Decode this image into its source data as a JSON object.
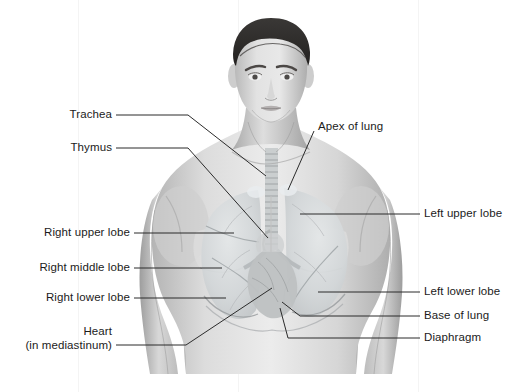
{
  "figure": {
    "background_color": "#ffffff",
    "line_color": "#2b2b2b",
    "text_color": "#1b1b1b",
    "illustration": {
      "name": "male-torso-anterior-view",
      "description": "Grayscale anterior view of a male head, neck, shoulders and chest with lungs, trachea, bronchi and heart shown within the thorax",
      "palette": {
        "skin_light": "#e6e6e6",
        "skin_mid": "#c9c9c9",
        "skin_shadow": "#a8a8a8",
        "hair_dark": "#2f2d2c",
        "lung_tint": "#d3d6d8",
        "airway": "#bfc3c5",
        "heart_tint": "#b9bcbd"
      }
    }
  },
  "labels": {
    "left": [
      {
        "id": "trachea",
        "text": "Trachea",
        "text2": ""
      },
      {
        "id": "thymus",
        "text": "Thymus",
        "text2": ""
      },
      {
        "id": "right-upper-lobe",
        "text": "Right upper lobe",
        "text2": ""
      },
      {
        "id": "right-middle-lobe",
        "text": "Right middle lobe",
        "text2": ""
      },
      {
        "id": "right-lower-lobe",
        "text": "Right lower lobe",
        "text2": ""
      },
      {
        "id": "heart",
        "text": "Heart",
        "text2": "(in mediastinum)"
      }
    ],
    "right": [
      {
        "id": "apex-of-lung",
        "text": "Apex of lung"
      },
      {
        "id": "left-upper-lobe",
        "text": "Left upper lobe"
      },
      {
        "id": "left-lower-lobe",
        "text": "Left lower lobe"
      },
      {
        "id": "base-of-lung",
        "text": "Base of lung"
      },
      {
        "id": "diaphragm",
        "text": "Diaphragm"
      }
    ]
  }
}
